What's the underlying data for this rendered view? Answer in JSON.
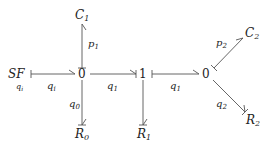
{
  "diagram": {
    "type": "bond-graph",
    "nodes": {
      "sf": {
        "label": "SF",
        "sub": "",
        "x": 20,
        "y": 78,
        "note": "q_i"
      },
      "j0a": {
        "label": "0",
        "x": 82,
        "y": 78
      },
      "j1": {
        "label": "1",
        "x": 143,
        "y": 78
      },
      "j0b": {
        "label": "0",
        "x": 206,
        "y": 78
      },
      "c1": {
        "label": "C",
        "sub": "1",
        "x": 82,
        "y": 19
      },
      "r0": {
        "label": "R",
        "sub": "0",
        "x": 82,
        "y": 138
      },
      "r1": {
        "label": "R",
        "sub": "1",
        "x": 144,
        "y": 138
      },
      "c2": {
        "label": "C",
        "sub": "2",
        "x": 250,
        "y": 37
      },
      "r2": {
        "label": "R",
        "sub": "2",
        "x": 252,
        "y": 124
      }
    },
    "bonds": [
      {
        "from": "sf",
        "to": "j0a",
        "label": "q",
        "sub": "i",
        "label_pos": "below"
      },
      {
        "from": "j0a",
        "to": "c1",
        "label": "p",
        "sub": "1",
        "label_pos": "right"
      },
      {
        "from": "j0a",
        "to": "j1",
        "label": "q",
        "sub": "1",
        "label_pos": "below"
      },
      {
        "from": "j0a",
        "to": "r0",
        "label": "q",
        "sub": "0",
        "label_pos": "left"
      },
      {
        "from": "j1",
        "to": "r1",
        "label": "",
        "sub": "",
        "label_pos": "none"
      },
      {
        "from": "j1",
        "to": "j0b",
        "label": "q",
        "sub": "1",
        "label_pos": "below"
      },
      {
        "from": "j0b",
        "to": "c2",
        "label": "p",
        "sub": "2",
        "label_pos": "left"
      },
      {
        "from": "j0b",
        "to": "r2",
        "label": "q",
        "sub": "2",
        "label_pos": "left"
      }
    ],
    "labels": {
      "sf_label": "SF",
      "sf_note": "q",
      "sf_note_sub": "i",
      "junction_0a": "0",
      "junction_1": "1",
      "junction_0b": "0",
      "c1_main": "C",
      "c1_sub": "1",
      "r0_main": "R",
      "r0_sub": "0",
      "r1_main": "R",
      "r1_sub": "1",
      "c2_main": "C",
      "c2_sub": "2",
      "r2_main": "R",
      "r2_sub": "2",
      "bond_sf_j0a": "q",
      "bond_sf_j0a_sub": "i",
      "bond_j0a_c1": "p",
      "bond_j0a_c1_sub": "1",
      "bond_j0a_j1": "q",
      "bond_j0a_j1_sub": "1",
      "bond_j0a_r0": "q",
      "bond_j0a_r0_sub": "0",
      "bond_j1_j0b": "q",
      "bond_j1_j0b_sub": "1",
      "bond_j0b_c2": "p",
      "bond_j0b_c2_sub": "2",
      "bond_j0b_r2": "q",
      "bond_j0b_r2_sub": "2"
    },
    "colors": {
      "stroke": "#555555",
      "text": "#222222",
      "background": "#ffffff"
    }
  }
}
